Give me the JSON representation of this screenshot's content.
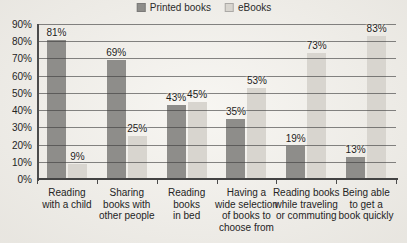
{
  "page": {
    "background": "#f5f3ee"
  },
  "legend": {
    "items": [
      {
        "name": "printed-books",
        "label": "Printed books",
        "color": "#8e8d8a"
      },
      {
        "name": "ebooks",
        "label": "eBooks",
        "color": "#d8d5cf"
      }
    ]
  },
  "chart_data": {
    "type": "bar",
    "title": "",
    "xlabel": "",
    "ylabel": "",
    "categories": [
      "Reading\nwith a child",
      "Sharing\nbooks with\nother people",
      "Reading\nbooks\nin bed",
      "Having a\nwide selection\nof books to\nchoose from",
      "Reading books\nwhile traveling\nor commuting",
      "Being able\nto get a\nbook quickly"
    ],
    "series": [
      {
        "name": "Printed books",
        "color": "#8e8d8a",
        "values": [
          81,
          69,
          43,
          35,
          19,
          13
        ]
      },
      {
        "name": "eBooks",
        "color": "#d8d5cf",
        "values": [
          9,
          25,
          45,
          53,
          73,
          83
        ]
      }
    ],
    "value_labels": [
      [
        "81%",
        "69%",
        "43%",
        "35%",
        "19%",
        "13%"
      ],
      [
        "9%",
        "25%",
        "45%",
        "53%",
        "73%",
        "83%"
      ]
    ],
    "yticks": [
      0,
      10,
      20,
      30,
      40,
      50,
      60,
      70,
      80,
      90
    ],
    "ytick_labels": [
      "0%",
      "10%",
      "20%",
      "30%",
      "40%",
      "50%",
      "60%",
      "70%",
      "80%",
      "90%"
    ],
    "ylim": [
      0,
      90
    ],
    "grid": true,
    "gridlines_in_front_of_bars": true,
    "legend_position": "top-center",
    "colors": {
      "gridline": "#3e3e3e",
      "axis": "#4c4c4c",
      "text": "#242424"
    }
  }
}
